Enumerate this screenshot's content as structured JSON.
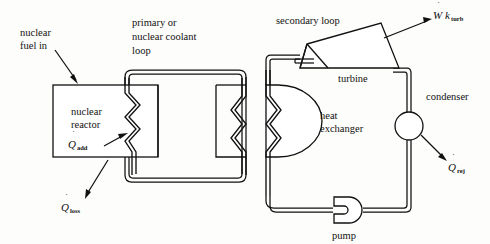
{
  "diagram": {
    "background_color": "#fdfdfb",
    "line_color": "#111111"
  },
  "labels": {
    "nuclear_fuel_in_line1": "nuclear",
    "nuclear_fuel_in_line2": "fuel in",
    "primary_loop_line1": "primary or",
    "primary_loop_line2": "nuclear coolant",
    "primary_loop_line3": "loop",
    "reactor_line1": "nuclear",
    "reactor_line2": "reactor",
    "secondary_loop": "secondary loop",
    "turbine": "turbine",
    "condenser": "condenser",
    "heat_exchanger_line1": "heat",
    "heat_exchanger_line2": "exchanger",
    "pump": "pump"
  },
  "symbols": {
    "q_add": {
      "base": "Q",
      "subscript": "add",
      "dot": "˙"
    },
    "q_loss": {
      "base": "Q",
      "subscript": "loss",
      "dot": "˙"
    },
    "q_rej": {
      "base": "Q",
      "subscript": "rej",
      "dot": "˙"
    },
    "wk_turb": {
      "base": "W",
      "base2": "k",
      "subscript": "turb",
      "dot": "˙"
    }
  },
  "components": [
    {
      "name": "nuclear-reactor",
      "shape": "rectangle"
    },
    {
      "name": "primary-loop",
      "shape": "closed-pipe-loop"
    },
    {
      "name": "heat-exchanger",
      "shape": "d-shape"
    },
    {
      "name": "turbine",
      "shape": "trapezoid"
    },
    {
      "name": "condenser",
      "shape": "circle"
    },
    {
      "name": "pump",
      "shape": "circle-with-notch"
    },
    {
      "name": "secondary-loop",
      "shape": "closed-pipe-loop"
    }
  ]
}
